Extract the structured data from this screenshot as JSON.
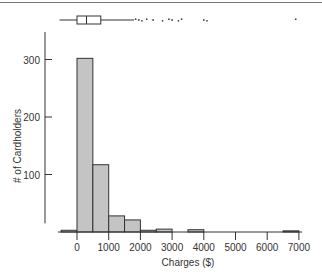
{
  "chart_data": {
    "type": "bar",
    "title": "",
    "xlabel": "Charges ($)",
    "ylabel": "# of Cardholders",
    "x_ticks": [
      0,
      1000,
      2000,
      3000,
      4000,
      5000,
      6000,
      7000
    ],
    "y_ticks": [
      100,
      200,
      300
    ],
    "xlim": [
      -500,
      7000
    ],
    "ylim": [
      0,
      350
    ],
    "grid": false,
    "bin_width": 500,
    "bins": [
      {
        "start": -500,
        "end": 0,
        "count": 3
      },
      {
        "start": 0,
        "end": 500,
        "count": 302
      },
      {
        "start": 500,
        "end": 1000,
        "count": 117
      },
      {
        "start": 1000,
        "end": 1500,
        "count": 28
      },
      {
        "start": 1500,
        "end": 2000,
        "count": 21
      },
      {
        "start": 2000,
        "end": 2500,
        "count": 3
      },
      {
        "start": 2500,
        "end": 3000,
        "count": 5
      },
      {
        "start": 3000,
        "end": 3500,
        "count": 0
      },
      {
        "start": 3500,
        "end": 4000,
        "count": 4
      },
      {
        "start": 4000,
        "end": 4500,
        "count": 0
      },
      {
        "start": 4500,
        "end": 5000,
        "count": 0
      },
      {
        "start": 5000,
        "end": 5500,
        "count": 0
      },
      {
        "start": 5500,
        "end": 6000,
        "count": 0
      },
      {
        "start": 6000,
        "end": 6500,
        "count": 0
      },
      {
        "start": 6500,
        "end": 7000,
        "count": 2
      }
    ],
    "boxplot": {
      "position": "top",
      "whisker_low": -550,
      "q1": 0,
      "median": 300,
      "q3": 750,
      "whisker_high": 1800,
      "outliers": [
        1850,
        1950,
        2050,
        2200,
        2400,
        2700,
        2900,
        3000,
        3200,
        3300,
        4000,
        4100,
        6900
      ]
    },
    "bar_color": "#c4c4c4",
    "edge_color": "#333333"
  }
}
